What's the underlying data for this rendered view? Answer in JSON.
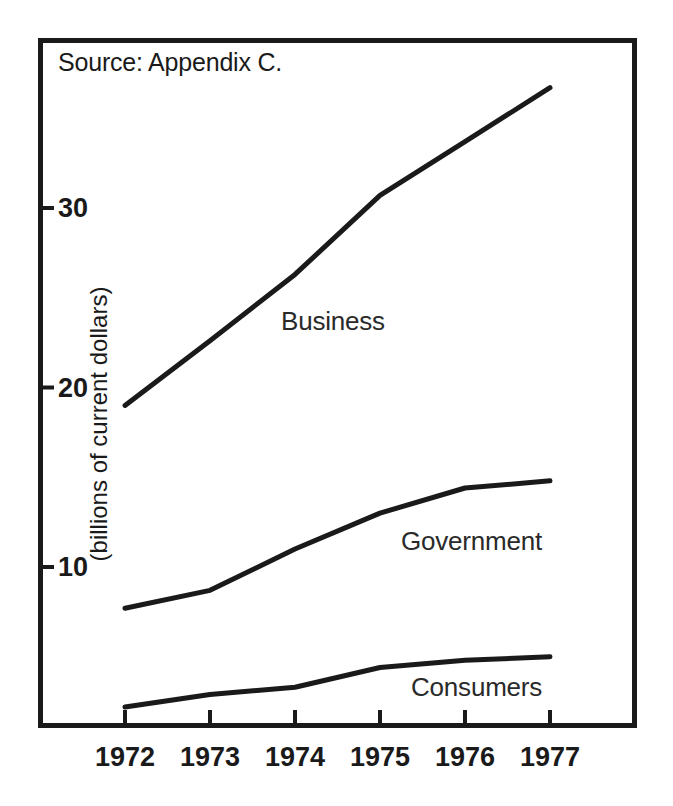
{
  "figure": {
    "source_note": "Source: Appendix C."
  },
  "chart_data": {
    "type": "line",
    "title": "",
    "subtitle": "",
    "xlabel": "",
    "ylabel": "(billions of current dollars)",
    "categories": [
      "1972",
      "1973",
      "1974",
      "1975",
      "1976",
      "1977"
    ],
    "x": [
      1972,
      1973,
      1974,
      1975,
      1976,
      1977
    ],
    "ytick_labels": [
      "30",
      "20",
      "10"
    ],
    "yticks": [
      30,
      20,
      10
    ],
    "ylim": [
      0,
      40
    ],
    "xlim": [
      1971.5,
      1977.5
    ],
    "grid": false,
    "legend_position": "inline-annotations",
    "series": [
      {
        "name": "Business",
        "values": [
          19.0,
          22.6,
          26.3,
          30.7,
          33.7,
          36.7
        ],
        "label": "Business"
      },
      {
        "name": "Government",
        "values": [
          7.7,
          8.7,
          11.0,
          13.0,
          14.4,
          14.8
        ],
        "label": "Government"
      },
      {
        "name": "Consumers",
        "values": [
          2.2,
          2.9,
          3.3,
          4.4,
          4.8,
          5.0
        ],
        "label": "Consumers"
      }
    ],
    "annotations": [
      {
        "text": "Business",
        "x": 1974.0,
        "y": 25.0
      },
      {
        "text": "Government",
        "x": 1975.3,
        "y": 13.0
      },
      {
        "text": "Consumers",
        "x": 1975.4,
        "y": 5.2
      },
      {
        "text": "Source: Appendix C.",
        "x": 1971.7,
        "y": 38.5
      }
    ],
    "colors": {
      "line": "#1a1a1a",
      "frame": "#1a1a1a",
      "background": "#ffffff",
      "text": "#1a1a1a"
    }
  }
}
